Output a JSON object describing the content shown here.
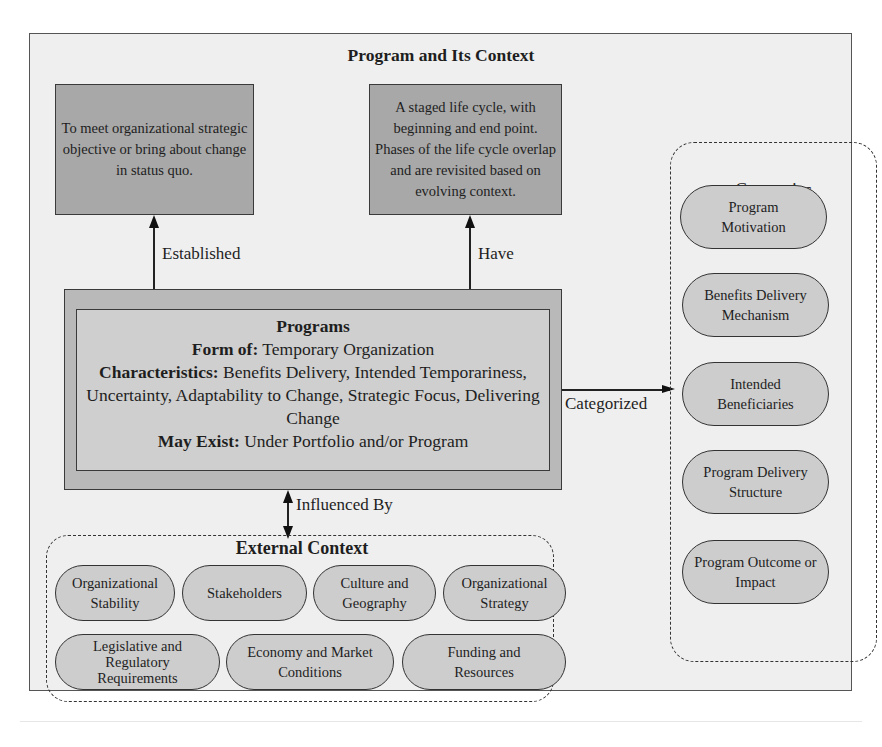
{
  "diagram": {
    "title": "Program and Its Context",
    "purpose_box": {
      "text": "To meet organizational strategic objective or bring about change in status quo."
    },
    "lifecycle_box": {
      "text": "A staged life cycle, with beginning and end point. Phases of the life cycle overlap and are revisited based on evolving context."
    },
    "relations": {
      "established": "Established",
      "have": "Have",
      "categorized": "Categorized",
      "influenced_by": "Influenced By"
    },
    "programs": {
      "title": "Programs",
      "form_of_label": "Form of",
      "form_of_value": "Temporary Organization",
      "characteristics_label": "Characteristics",
      "characteristics_value": "Benefits Delivery, Intended Temporariness, Uncertainty, Adaptability to Change, Strategic Focus, Delivering Change",
      "may_exist_label": "May Exist",
      "may_exist_value": "Under Portfolio and/or Program"
    },
    "categories": {
      "title": "Categories",
      "items": [
        "Program Motivation",
        "Benefits Delivery Mechanism",
        "Intended Beneficiaries",
        "Program Delivery Structure",
        "Program Outcome or Impact"
      ]
    },
    "external_context": {
      "title": "External Context",
      "row1": [
        "Organizational Stability",
        "Stakeholders",
        "Culture and Geography",
        "Organizational Strategy"
      ],
      "row2": [
        "Legislative and Regulatory Requirements",
        "Economy and Market Conditions",
        "Funding and Resources"
      ]
    },
    "colors": {
      "background": "#efefef",
      "dark_box": "#a8a8a8",
      "programs_outer": "#b9b9b9",
      "programs_inner": "#cfcfcf",
      "pill": "#cdcdcd",
      "stroke": "#333333"
    }
  }
}
